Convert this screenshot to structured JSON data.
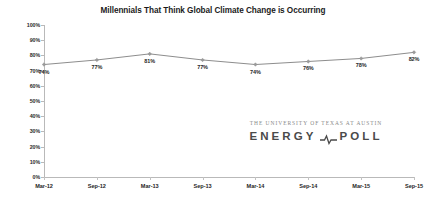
{
  "chart_data": {
    "type": "line",
    "title": "Millennials That Think Global Climate Change is Occurring",
    "xlabel": "",
    "ylabel": "",
    "categories": [
      "Mar-12",
      "Sep-12",
      "Mar-13",
      "Sep-13",
      "Mar-14",
      "Sep-14",
      "Mar-15",
      "Sep-15"
    ],
    "values": [
      74,
      77,
      81,
      77,
      74,
      76,
      78,
      82
    ],
    "point_labels": [
      "74%",
      "77%",
      "81%",
      "77%",
      "74%",
      "76%",
      "78%",
      "82%"
    ],
    "ylim": [
      0,
      100
    ],
    "ytick_labels": [
      "100%",
      "90%",
      "80%",
      "70%",
      "60%",
      "50%",
      "40%",
      "30%",
      "20%",
      "10%",
      "0%"
    ],
    "ytick_values": [
      100,
      90,
      80,
      70,
      60,
      50,
      40,
      30,
      20,
      10,
      0
    ],
    "grid": false,
    "legend": false,
    "series_color": "#8d8d8d",
    "marker_color": "#9a9a9a",
    "axis_color": "#b9b9b9",
    "label_color": "#1f1f1f",
    "title_color": "#1b1b1b",
    "background": "#ffffff"
  },
  "logo": {
    "university": "THE UNIVERSITY OF TEXAS AT AUSTIN",
    "word_left": "ENERGY",
    "word_right": "POLL",
    "pulse_icon": "pulse-icon",
    "university_color": "#8a8a8a",
    "wordmark_color": "#4a4a4a"
  }
}
